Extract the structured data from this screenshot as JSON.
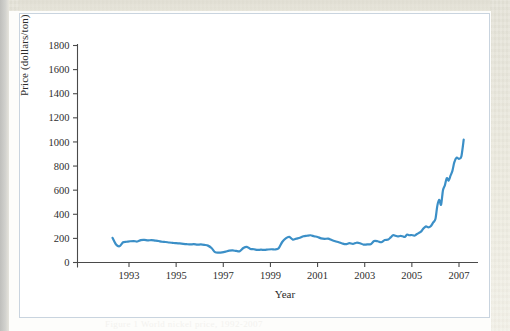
{
  "figure": {
    "caption_bleed": "Figure 1  World nickel price, 1992-2007"
  },
  "chart_data": {
    "type": "line",
    "title": "",
    "xlabel": "Year",
    "ylabel": "Price (dollars/ton)",
    "xlim": [
      1992.3,
      2007.3
    ],
    "ylim": [
      0,
      1800
    ],
    "grid": false,
    "legend": "none",
    "line_color": "#3b8fc7",
    "x_ticks": [
      1993,
      1995,
      1997,
      1999,
      2001,
      2003,
      2005,
      2007
    ],
    "x_tick_labels": [
      "1993",
      "1995",
      "1997",
      "1999",
      "2001",
      "2003",
      "2005",
      "2007"
    ],
    "y_ticks": [
      0,
      200,
      400,
      600,
      800,
      1000,
      1200,
      1400,
      1600,
      1800
    ],
    "y_tick_labels": [
      "0",
      "200",
      "400",
      "600",
      "800",
      "1000",
      "1200",
      "1400",
      "1600",
      "1800"
    ],
    "series": [
      {
        "name": "Price",
        "x": [
          1992.3,
          1992.45,
          1992.6,
          1992.75,
          1992.9,
          1993.05,
          1993.2,
          1993.35,
          1993.5,
          1993.65,
          1993.8,
          1993.95,
          1994.1,
          1994.25,
          1994.4,
          1994.55,
          1994.7,
          1994.85,
          1995.0,
          1995.15,
          1995.3,
          1995.45,
          1995.6,
          1995.75,
          1995.9,
          1996.05,
          1996.2,
          1996.35,
          1996.5,
          1996.65,
          1996.8,
          1996.95,
          1997.1,
          1997.25,
          1997.4,
          1997.55,
          1997.7,
          1997.85,
          1998.0,
          1998.15,
          1998.3,
          1998.45,
          1998.6,
          1998.75,
          1998.9,
          1999.05,
          1999.2,
          1999.35,
          1999.5,
          1999.65,
          1999.8,
          1999.95,
          2000.1,
          2000.25,
          2000.4,
          2000.55,
          2000.7,
          2000.85,
          2001.0,
          2001.15,
          2001.3,
          2001.45,
          2001.6,
          2001.75,
          2001.9,
          2002.05,
          2002.2,
          2002.35,
          2002.5,
          2002.65,
          2002.8,
          2002.95,
          2003.1,
          2003.25,
          2003.4,
          2003.55,
          2003.7,
          2003.85,
          2004.0,
          2004.1,
          2004.2,
          2004.3,
          2004.4,
          2004.5,
          2004.6,
          2004.7,
          2004.8,
          2004.9,
          2005.0,
          2005.1,
          2005.2,
          2005.3,
          2005.4,
          2005.5,
          2005.6,
          2005.7,
          2005.8,
          2005.9,
          2006.0,
          2006.08,
          2006.16,
          2006.24,
          2006.32,
          2006.4,
          2006.48,
          2006.56,
          2006.64,
          2006.72,
          2006.8,
          2006.9,
          2007.0,
          2007.1,
          2007.2
        ],
        "y": [
          205,
          150,
          135,
          168,
          172,
          176,
          178,
          174,
          186,
          188,
          183,
          186,
          182,
          178,
          172,
          170,
          166,
          163,
          160,
          158,
          155,
          152,
          150,
          152,
          148,
          150,
          146,
          140,
          120,
          86,
          82,
          84,
          90,
          98,
          100,
          96,
          94,
          120,
          130,
          112,
          110,
          104,
          106,
          104,
          108,
          110,
          108,
          118,
          170,
          200,
          212,
          190,
          198,
          205,
          218,
          222,
          226,
          218,
          212,
          200,
          196,
          198,
          186,
          176,
          168,
          158,
          152,
          160,
          154,
          164,
          160,
          148,
          150,
          152,
          178,
          176,
          168,
          186,
          190,
          208,
          226,
          222,
          216,
          220,
          218,
          212,
          232,
          226,
          228,
          222,
          234,
          246,
          258,
          284,
          300,
          292,
          300,
          330,
          360,
          470,
          520,
          480,
          600,
          640,
          700,
          680,
          720,
          760,
          830,
          870,
          860,
          880,
          1020
        ]
      }
    ],
    "annotations": {
      "peak_value": 1600,
      "peak_year": 2006.3,
      "final_value": 430,
      "final_year": 2007.2
    }
  }
}
